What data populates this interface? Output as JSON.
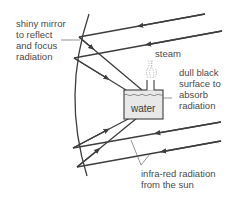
{
  "diagram": {
    "type": "solar-concentrator",
    "colors": {
      "line": "#3d3d3d",
      "text": "#4a4a4a",
      "water_fill": "#e6e6e6",
      "steam": "#9a9a9a"
    },
    "labels": {
      "mirror": "shiny mirror\nto reflect\nand focus\nradiation",
      "steam": "steam",
      "surface": "dull black\nsurface to\nabsorb\nradiation",
      "water": "water",
      "infrared": "infra-red radiation\nfrom the sun"
    }
  }
}
